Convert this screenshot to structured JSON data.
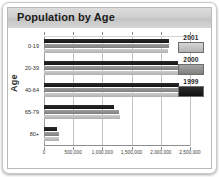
{
  "header": {
    "title": "Population by Age"
  },
  "chart_data": {
    "type": "bar",
    "orientation": "horizontal",
    "title": "Population by Age",
    "xlabel": "",
    "ylabel": "Age",
    "categories": [
      "0-19",
      "20-39",
      "40-64",
      "65-79",
      "80+"
    ],
    "series": [
      {
        "name": "2001",
        "color": "#c0c0c0",
        "values": [
          2130000,
          2390000,
          2410000,
          1295000,
          265000
        ]
      },
      {
        "name": "2000",
        "color": "#8c8c8c",
        "values": [
          2135000,
          2375000,
          2365000,
          1285000,
          258000
        ]
      },
      {
        "name": "1999",
        "color": "#1c1c1c",
        "values": [
          2135000,
          2300000,
          2310000,
          1200000,
          225000
        ]
      }
    ],
    "xlim": [
      0,
      2500000
    ],
    "xticks": [
      0,
      500000,
      1000000,
      1500000,
      2000000,
      2500000
    ],
    "xticklabels": [
      "0",
      "500,000",
      "1,000,000",
      "1,500,000",
      "2,000,000",
      "2,500,000"
    ],
    "grid": true,
    "legend_position": "right",
    "legend_entries": [
      "2001",
      "2000",
      "1999"
    ]
  }
}
